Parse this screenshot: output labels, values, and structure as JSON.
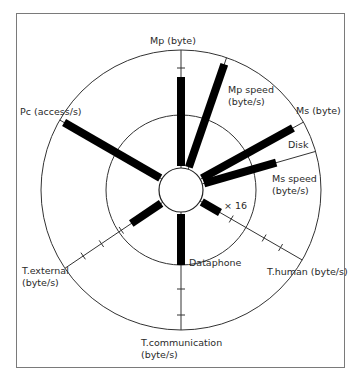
{
  "diagram": {
    "type": "kiviat-graph",
    "center": {
      "x": 181,
      "y": 190
    },
    "hub_radius": 22,
    "inner_circle_radius": 75,
    "outer_circle_radius": 140,
    "colors": {
      "bar": "#000000",
      "line": "#333333",
      "frame": "#7a7a7a",
      "background": "#ffffff"
    },
    "axes": [
      {
        "id": "mp",
        "label": "Mp (byte)",
        "angle_deg": 0,
        "bar_length": 113,
        "ticks": [
          122
        ]
      },
      {
        "id": "mp-speed",
        "label_line1": "Mp speed",
        "label_line2": "(byte/s)",
        "angle_deg": 19,
        "bar_length": 133,
        "ticks": []
      },
      {
        "id": "ms",
        "label": "Ms (byte)",
        "bar_label": "Disk",
        "angle_deg": 61,
        "bar_length": 128,
        "ticks": []
      },
      {
        "id": "ms-speed",
        "label_line1": "Ms speed",
        "label_line2": "(byte/s)",
        "angle_deg": 74,
        "bar_length": 99,
        "ticks": []
      },
      {
        "id": "t-human",
        "label": "T.human (byte/s)",
        "bar_label": "× 16",
        "angle_deg": 120,
        "bar_length": 45,
        "ticks": [
          58,
          96,
          115
        ]
      },
      {
        "id": "t-communication",
        "label_line1": "T.communication",
        "label_line2": "(byte/s)",
        "bar_label": "Dataphone",
        "angle_deg": 180,
        "bar_length": 75,
        "ticks": [
          99,
          125
        ]
      },
      {
        "id": "t-external",
        "label_line1": "T.external",
        "label_line2": "(byte/s)",
        "angle_deg": 236,
        "bar_length": 60,
        "ticks": [
          72,
          96,
          118
        ]
      },
      {
        "id": "pc",
        "label": "Pc (access/s)",
        "angle_deg": 300,
        "bar_length": 135,
        "ticks": []
      }
    ]
  },
  "labels": {
    "mp": "Mp (byte)",
    "mp_speed_1": "Mp speed",
    "mp_speed_2": "(byte/s)",
    "ms": "Ms (byte)",
    "disk": "Disk",
    "ms_speed_1": "Ms speed",
    "ms_speed_2": "(byte/s)",
    "x16": "× 16",
    "t_human": "T.human (byte/s)",
    "dataphone": "Dataphone",
    "t_comm_1": "T.communication",
    "t_comm_2": "(byte/s)",
    "t_ext_1": "T.external",
    "t_ext_2": "(byte/s)",
    "pc": "Pc (access/s)"
  }
}
